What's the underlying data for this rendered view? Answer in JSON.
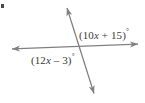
{
  "figure": {
    "type": "geometry-diagram",
    "background_color": "#ffffff",
    "line_color": "#808080",
    "text_color": "#3a3a3a",
    "lines": [
      {
        "name": "horizontal-line",
        "x1": 10,
        "y1": 49,
        "x2": 140,
        "y2": 44,
        "arrow_start": true,
        "arrow_end": true
      },
      {
        "name": "diagonal-line",
        "x1": 66,
        "y1": 5,
        "x2": 95,
        "y2": 96,
        "arrow_start": true,
        "arrow_end": true
      }
    ],
    "intersection": {
      "x": 77,
      "y": 47
    },
    "labels": [
      {
        "name": "upper-right-angle-label",
        "prefix": "(10",
        "variable": "x",
        "suffix": " + 15)",
        "degree": "°",
        "full_text": "(10x + 15)°",
        "position": "upper-right"
      },
      {
        "name": "lower-left-angle-label",
        "prefix": "(12",
        "variable": "x",
        "suffix": " – 3)",
        "degree": "°",
        "full_text": "(12x – 3)°",
        "position": "lower-left"
      }
    ]
  }
}
